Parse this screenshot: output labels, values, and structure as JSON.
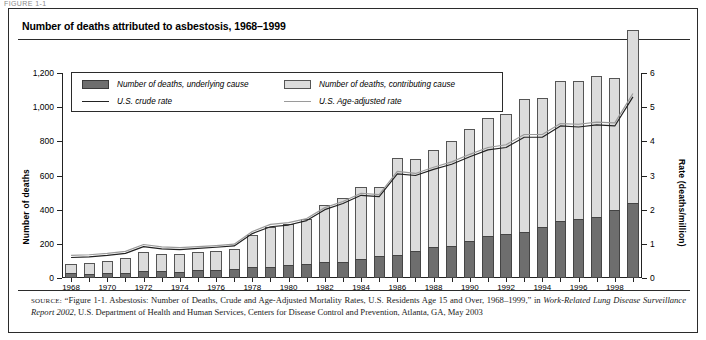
{
  "page": {
    "cutoff_header": "FIGURE 1-1"
  },
  "figure": {
    "title": "Number of deaths attributed to asbestosis, 1968–1999",
    "source_prefix": "SOURCE:",
    "source_part1": " “Figure 1-1. Asbestosis: Number of Deaths, Crude and Age-Adjusted Mortality Rates, U.S. Residents Age 15 and Over, 1968–1999,” in ",
    "source_italic1": "Work-Related Lung Disease Surveillance Report 2002",
    "source_part2": ", U.S. Department of Health and Human Services, Centers for Disease Control and Prevention, Atlanta, GA, May 2003"
  },
  "legend": {
    "items": [
      {
        "label": "Number of deaths, underlying cause",
        "marker": "swatch-dark",
        "color": "#6e6e6e"
      },
      {
        "label": "Number of deaths, contributing cause",
        "marker": "swatch-light",
        "color": "#dcdcdc"
      },
      {
        "label": "U.S. crude rate",
        "marker": "line-dark",
        "color": "#222222"
      },
      {
        "label": "U.S. Age-adjusted rate",
        "marker": "line-grey",
        "color": "#9a9a9a"
      }
    ]
  },
  "chart_data": {
    "type": "bar",
    "title": "Number of deaths attributed to asbestosis, 1968–1999",
    "xlabel": "",
    "ylabel": "Number of deaths",
    "y2label": "Rate (deaths/million)",
    "ylim": [
      0,
      1200
    ],
    "y2lim": [
      0,
      6
    ],
    "yticks": [
      0,
      200,
      400,
      600,
      800,
      1000,
      1200
    ],
    "ytick_labels": [
      "0",
      "200",
      "400",
      "600",
      "800",
      "1,000",
      "1,200"
    ],
    "y2ticks": [
      0,
      1,
      2,
      3,
      4,
      5,
      6
    ],
    "y2tick_labels": [
      "0",
      "1",
      "2",
      "3",
      "4",
      "5",
      "6"
    ],
    "grid": false,
    "legend_position": "top-left-inside",
    "stacked": true,
    "x": [
      1968,
      1969,
      1970,
      1971,
      1972,
      1973,
      1974,
      1975,
      1976,
      1977,
      1978,
      1979,
      1980,
      1981,
      1982,
      1983,
      1984,
      1985,
      1986,
      1987,
      1988,
      1989,
      1990,
      1991,
      1992,
      1993,
      1994,
      1995,
      1996,
      1997,
      1998,
      1999
    ],
    "xtick_labels": [
      "1968",
      "",
      "1970",
      "",
      "1972",
      "",
      "1974",
      "",
      "1976",
      "",
      "1978",
      "",
      "1980",
      "",
      "1982",
      "",
      "1984",
      "",
      "1986",
      "",
      "1988",
      "",
      "1990",
      "",
      "1992",
      "",
      "1994",
      "",
      "1996",
      "",
      "1998",
      ""
    ],
    "series": [
      {
        "name": "Number of deaths, underlying cause",
        "color": "#6e6e6e",
        "values": [
          27,
          24,
          27,
          30,
          43,
          41,
          38,
          45,
          48,
          52,
          63,
          67,
          75,
          83,
          92,
          95,
          110,
          130,
          135,
          160,
          180,
          190,
          215,
          245,
          255,
          270,
          300,
          335,
          345,
          355,
          400,
          440
        ]
      },
      {
        "name": "Number of deaths, contributing cause",
        "color": "#dcdcdc",
        "values": [
          53,
          66,
          73,
          85,
          107,
          99,
          102,
          105,
          112,
          118,
          187,
          233,
          240,
          265,
          333,
          375,
          420,
          400,
          565,
          535,
          570,
          610,
          655,
          690,
          705,
          780,
          755,
          820,
          810,
          825,
          770,
          1010
        ]
      }
    ],
    "totals": [
      80,
      90,
      100,
      115,
      150,
      140,
      140,
      150,
      160,
      170,
      250,
      300,
      315,
      348,
      425,
      470,
      530,
      530,
      700,
      695,
      750,
      800,
      870,
      935,
      960,
      1050,
      1055,
      1155,
      1155,
      1180,
      1170,
      1450
    ],
    "lines": [
      {
        "name": "U.S. crude rate",
        "color": "#222222",
        "axis": "right",
        "values": [
          0.6,
          0.62,
          0.66,
          0.72,
          0.92,
          0.85,
          0.83,
          0.87,
          0.9,
          0.94,
          1.3,
          1.5,
          1.55,
          1.68,
          2.0,
          2.18,
          2.42,
          2.38,
          3.05,
          3.0,
          3.18,
          3.33,
          3.55,
          3.75,
          3.82,
          4.12,
          4.12,
          4.45,
          4.42,
          4.48,
          4.45,
          5.3
        ]
      },
      {
        "name": "U.S. Age-adjusted rate",
        "color": "#9a9a9a",
        "axis": "right",
        "values": [
          0.66,
          0.68,
          0.72,
          0.78,
          0.98,
          0.91,
          0.89,
          0.92,
          0.95,
          0.99,
          1.36,
          1.57,
          1.62,
          1.74,
          2.06,
          2.24,
          2.48,
          2.44,
          3.12,
          3.06,
          3.24,
          3.4,
          3.62,
          3.82,
          3.9,
          4.2,
          4.2,
          4.52,
          4.5,
          4.56,
          4.54,
          5.4
        ]
      }
    ]
  }
}
